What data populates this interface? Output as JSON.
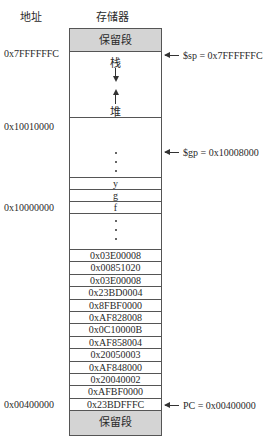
{
  "headers": {
    "address": "地址",
    "memory": "存储器"
  },
  "segments": {
    "reserved_top": "保留段",
    "stack": "栈",
    "heap": "堆",
    "reserved_bottom": "保留段"
  },
  "addresses": {
    "stack_top": "0x7FFFFFFC",
    "heap_base": "0x10010000",
    "data_base": "0x10000000",
    "text_base": "0x00400000"
  },
  "pointers": {
    "sp": "$sp = 0x7FFFFFFC",
    "gp": "$gp = 0x10008000",
    "pc": "PC = 0x00400000"
  },
  "data_vars": [
    "y",
    "g",
    "f"
  ],
  "instructions": [
    "0x03E00008",
    "0x00851020",
    "0x03E00008",
    "0x23BD0004",
    "0x8FBF0000",
    "0xAF828008",
    "0x0C10000B",
    "0xAF858004",
    "0x20050003",
    "0xAF848000",
    "0x20040002",
    "0xAFBF0000",
    "0x23BDFFFC"
  ],
  "colors": {
    "reserved_fill": "#d4d4d4",
    "border": "#555555"
  }
}
